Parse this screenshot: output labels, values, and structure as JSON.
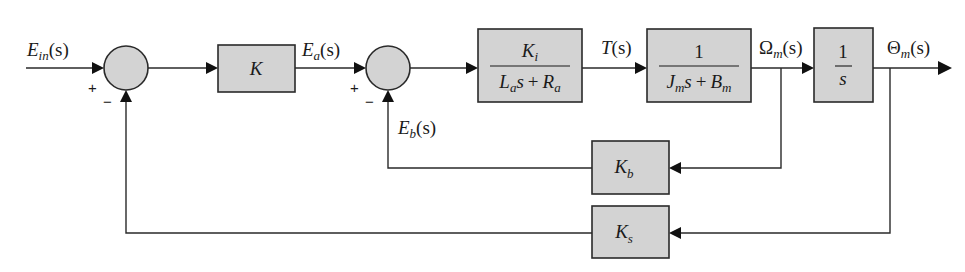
{
  "diagram": {
    "type": "block-diagram",
    "colors": {
      "block_fill": "#d3d3d3",
      "line": "#2a2a2a",
      "background": "#ffffff"
    },
    "signals": {
      "input": {
        "main": "E",
        "sub": "in",
        "arg": "(s)"
      },
      "ea": {
        "main": "E",
        "sub": "a",
        "arg": "(s)"
      },
      "eb": {
        "main": "E",
        "sub": "b",
        "arg": "(s)"
      },
      "torque": {
        "main": "T",
        "arg": "(s)"
      },
      "omega": {
        "main": "Ω",
        "sub": "m",
        "arg": "(s)"
      },
      "theta": {
        "main": "Θ",
        "sub": "m",
        "arg": "(s)"
      }
    },
    "summing_junctions": [
      {
        "id": "sum1",
        "plus": "+",
        "minus": "−"
      },
      {
        "id": "sum2",
        "plus": "+",
        "minus": "−"
      }
    ],
    "blocks": {
      "gain_k": {
        "label": "K"
      },
      "armature": {
        "num_main": "K",
        "num_sub": "i",
        "den_a_main": "L",
        "den_a_sub": "a",
        "den_a_s": "s",
        "plus": "+",
        "den_b_main": "R",
        "den_b_sub": "a"
      },
      "mechanical": {
        "num": "1",
        "den_a_main": "J",
        "den_a_sub": "m",
        "den_a_s": "s",
        "plus": "+",
        "den_b_main": "B",
        "den_b_sub": "m"
      },
      "integrator": {
        "num": "1",
        "den": "s"
      },
      "back_emf": {
        "main": "K",
        "sub": "b"
      },
      "sensor": {
        "main": "K",
        "sub": "s"
      }
    }
  }
}
